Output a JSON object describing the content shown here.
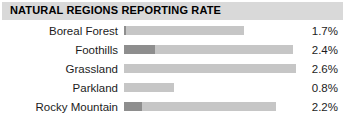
{
  "header": {
    "title": "NATURAL REGIONS REPORTING RATE",
    "band_color": "#d9d9d9"
  },
  "colors": {
    "bar_fill": "#c6c6c6",
    "bar_lead": "#8e8e8e",
    "text": "#1c1c1c",
    "background": "#ffffff"
  },
  "chart_data": {
    "type": "bar",
    "title": "NATURAL REGIONS REPORTING RATE",
    "orientation": "horizontal",
    "xlabel": "",
    "ylabel": "",
    "grid": false,
    "legend": "none",
    "value_suffix": "%",
    "xlim": [
      0,
      2.8
    ],
    "categories": [
      "Boreal Forest",
      "Foothills",
      "Grassland",
      "Parkland",
      "Rocky Mountain"
    ],
    "values": [
      1.7,
      2.4,
      2.6,
      0.8,
      2.2
    ],
    "value_labels": [
      "1.7%",
      "2.4%",
      "2.6%",
      "0.8%",
      "2.2%"
    ],
    "bar_px_widths": [
      120,
      169,
      172,
      50,
      152
    ],
    "lead_px_widths": [
      2,
      31,
      0,
      0,
      18
    ]
  },
  "rows": [
    {
      "label": "Boreal Forest",
      "value": "1.7%",
      "bar_width_px": 120,
      "lead_width_px": 2
    },
    {
      "label": "Foothills",
      "value": "2.4%",
      "bar_width_px": 169,
      "lead_width_px": 31
    },
    {
      "label": "Grassland",
      "value": "2.6%",
      "bar_width_px": 172,
      "lead_width_px": 0
    },
    {
      "label": "Parkland",
      "value": "0.8%",
      "bar_width_px": 50,
      "lead_width_px": 0
    },
    {
      "label": "Rocky Mountain",
      "value": "2.2%",
      "bar_width_px": 152,
      "lead_width_px": 18
    }
  ]
}
